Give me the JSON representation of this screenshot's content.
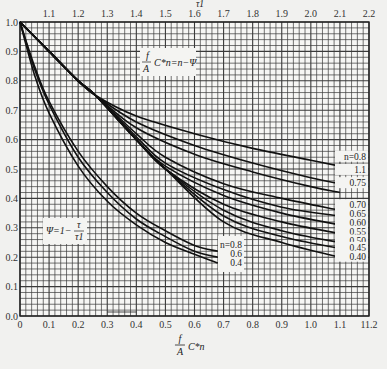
{
  "chart_data": {
    "type": "line",
    "title": "",
    "xlabel": "f/A C*n",
    "xlabel_top": "τ1",
    "ylabel": "",
    "xlim": [
      0,
      1.2
    ],
    "ylim": [
      0,
      1.0
    ],
    "xlim_top": [
      1.0,
      2.2
    ],
    "grid": true,
    "x_ticks": [
      "0",
      "0.1",
      "0.2",
      "0.3",
      "0.4",
      "0.5",
      "0.6",
      "0.7",
      "0.8",
      "0.9",
      "1.0",
      "1.1",
      "11.2"
    ],
    "x_ticks_top": [
      "1.1",
      "1.2",
      "1.3",
      "1.4",
      "1.5",
      "1.6",
      "1.7",
      "1.8",
      "1.9",
      "2.0",
      "2.1",
      "2.2"
    ],
    "y_ticks": [
      "0.0",
      "0.1",
      "0.2",
      "0.3",
      "0.4",
      "0.5",
      "0.6",
      "0.7",
      "0.8",
      "0.9",
      "1.0"
    ],
    "annotations": [
      {
        "text": "f/A C*n = n − Ψ",
        "x": 0.55,
        "y": 0.9
      },
      {
        "text": "Ψ = 1 − τ/τ1",
        "x": 0.08,
        "y": 0.3
      }
    ],
    "series_group_lower": [
      {
        "name": "n=0.8",
        "x": [
          0,
          0.05,
          0.1,
          0.2,
          0.3,
          0.4,
          0.5,
          0.6,
          0.68
        ],
        "y": [
          1.0,
          0.85,
          0.73,
          0.56,
          0.44,
          0.35,
          0.29,
          0.24,
          0.22
        ]
      },
      {
        "name": "0.6",
        "x": [
          0,
          0.05,
          0.1,
          0.2,
          0.3,
          0.4,
          0.5,
          0.6,
          0.68
        ],
        "y": [
          1.0,
          0.84,
          0.72,
          0.54,
          0.42,
          0.33,
          0.27,
          0.22,
          0.2
        ]
      },
      {
        "name": "0.4",
        "x": [
          0,
          0.05,
          0.1,
          0.2,
          0.3,
          0.4,
          0.5,
          0.6,
          0.68
        ],
        "y": [
          1.0,
          0.82,
          0.69,
          0.51,
          0.39,
          0.31,
          0.25,
          0.21,
          0.18
        ]
      }
    ],
    "series": [
      {
        "name": "n=0.8",
        "x": [
          0,
          0.1,
          0.2,
          0.26,
          0.4,
          0.6,
          0.8,
          1.0,
          1.1
        ],
        "y": [
          1.0,
          0.9,
          0.8,
          0.75,
          0.68,
          0.62,
          0.57,
          0.53,
          0.51
        ]
      },
      {
        "name": "1.1",
        "x": [
          0,
          0.1,
          0.2,
          0.26,
          0.4,
          0.6,
          0.8,
          1.0,
          1.1
        ],
        "y": [
          1.0,
          0.9,
          0.8,
          0.75,
          0.66,
          0.58,
          0.52,
          0.47,
          0.45
        ]
      },
      {
        "name": "0.75",
        "x": [
          0,
          0.1,
          0.2,
          0.26,
          0.4,
          0.6,
          0.8,
          1.0,
          1.1
        ],
        "y": [
          1.0,
          0.9,
          0.8,
          0.75,
          0.64,
          0.55,
          0.49,
          0.44,
          0.42
        ]
      },
      {
        "name": "0.70",
        "x": [
          0,
          0.1,
          0.2,
          0.26,
          0.4,
          0.5,
          0.7,
          0.9,
          1.1
        ],
        "y": [
          1.0,
          0.9,
          0.8,
          0.75,
          0.62,
          0.54,
          0.45,
          0.4,
          0.36
        ]
      },
      {
        "name": "0.65",
        "x": [
          0,
          0.1,
          0.2,
          0.26,
          0.4,
          0.5,
          0.7,
          0.9,
          1.1
        ],
        "y": [
          1.0,
          0.9,
          0.8,
          0.75,
          0.61,
          0.52,
          0.43,
          0.37,
          0.34
        ]
      },
      {
        "name": "0.60",
        "x": [
          0,
          0.1,
          0.2,
          0.26,
          0.4,
          0.5,
          0.7,
          0.9,
          1.1
        ],
        "y": [
          1.0,
          0.9,
          0.8,
          0.75,
          0.6,
          0.51,
          0.41,
          0.35,
          0.31
        ]
      },
      {
        "name": "0.55",
        "x": [
          0,
          0.1,
          0.2,
          0.26,
          0.4,
          0.5,
          0.7,
          0.9,
          1.1
        ],
        "y": [
          1.0,
          0.9,
          0.8,
          0.75,
          0.6,
          0.5,
          0.38,
          0.32,
          0.28
        ]
      },
      {
        "name": "0.50",
        "x": [
          0,
          0.1,
          0.2,
          0.26,
          0.4,
          0.5,
          0.7,
          0.9,
          1.1
        ],
        "y": [
          1.0,
          0.9,
          0.8,
          0.75,
          0.6,
          0.5,
          0.36,
          0.29,
          0.25
        ]
      },
      {
        "name": "0.45",
        "x": [
          0,
          0.1,
          0.2,
          0.26,
          0.4,
          0.5,
          0.7,
          0.9,
          1.1
        ],
        "y": [
          1.0,
          0.9,
          0.8,
          0.75,
          0.6,
          0.5,
          0.34,
          0.27,
          0.23
        ]
      },
      {
        "name": "0.40",
        "x": [
          0,
          0.1,
          0.2,
          0.26,
          0.4,
          0.5,
          0.7,
          0.9,
          1.1
        ],
        "y": [
          1.0,
          0.9,
          0.8,
          0.75,
          0.6,
          0.5,
          0.32,
          0.25,
          0.2
        ]
      }
    ],
    "right_labels": [
      "n=0.8",
      "1.1",
      "0.75",
      "0.70",
      "0.65",
      "0.60",
      "0.55",
      "0.50",
      "0.45",
      "0.40"
    ],
    "lower_labels": [
      "n=0.8",
      "0.6",
      "0.4"
    ]
  },
  "labels": {
    "top_axis_symbol": "τ1",
    "formula_top": "f/A C*n = n − Ψ",
    "formula_psi": "Ψ = 1 − τ/τ1",
    "bottom_axis": "f/A C*n"
  }
}
